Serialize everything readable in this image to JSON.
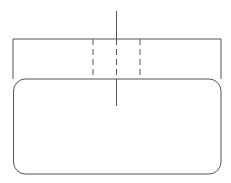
{
  "diagram": {
    "width": 231,
    "height": 183,
    "stroke_color": "#555555",
    "background": "#ffffff",
    "outer_rect": {
      "x": 13,
      "y": 39,
      "w": 208,
      "h": 135
    },
    "inner_rounded_rect": {
      "x": 14,
      "y": 79,
      "w": 206,
      "h": 95,
      "rx": 12
    },
    "dashed_box": {
      "x1": 93,
      "x2": 140,
      "y1": 39,
      "y2": 79
    },
    "center_axis": {
      "x": 116,
      "y1": 11,
      "y2": 106
    }
  }
}
